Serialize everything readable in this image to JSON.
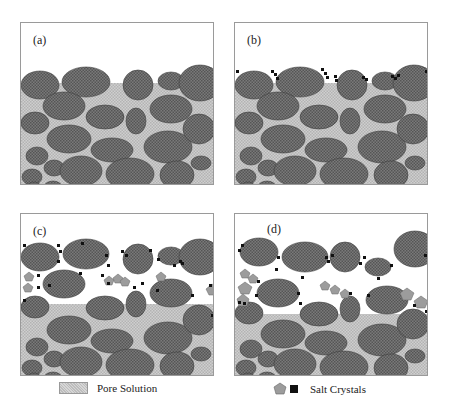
{
  "panels": [
    {
      "id": "a",
      "label": "(a)",
      "stage": "saturated"
    },
    {
      "id": "b",
      "label": "(b)",
      "stage": "surface crystallization"
    },
    {
      "id": "c",
      "label": "(c)",
      "stage": "subsurface crystallization"
    },
    {
      "id": "d",
      "label": "(d)",
      "stage": "grain displacement"
    }
  ],
  "legend": {
    "pore_solution": "Pore Solution",
    "salt_crystals": "Salt Crystals"
  },
  "colors": {
    "grain": "#6f6f6f",
    "grain_stroke": "#3e3e3e",
    "pore_solution": "#c4c4c4",
    "crystal_pentagon": "#9c9c9c",
    "crystal_square": "#111111",
    "border": "#9a9a9a"
  }
}
